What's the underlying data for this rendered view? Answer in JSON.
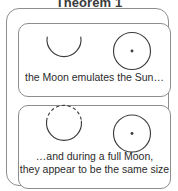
{
  "figure": {
    "title": "Theorem 1",
    "colors": {
      "background": "#ffffff",
      "line": "#3d3d3d",
      "frame": "#8d8d8d",
      "text": "#2b2b2b",
      "title_text": "#3a3a3a"
    },
    "panels": [
      {
        "id": "panel-top",
        "caption_lines": [
          "the Moon emulates the Sun…"
        ],
        "symbols": [
          {
            "name": "moon-crescent",
            "kind": "arc",
            "label": "Moon (crescent)",
            "style": "solid"
          },
          {
            "name": "sun-disc",
            "kind": "circle-with-center-dot",
            "label": "Sun",
            "style": "solid"
          }
        ]
      },
      {
        "id": "panel-bottom",
        "caption_lines": [
          "…and during a full Moon,",
          "they appear to be the same size"
        ],
        "symbols": [
          {
            "name": "moon-full",
            "kind": "circle-half-dashed",
            "label": "Full Moon",
            "style": "top arc dashed, bottom arc solid"
          },
          {
            "name": "sun-disc",
            "kind": "circle-with-center-dot",
            "label": "Sun",
            "style": "solid"
          }
        ]
      }
    ]
  }
}
